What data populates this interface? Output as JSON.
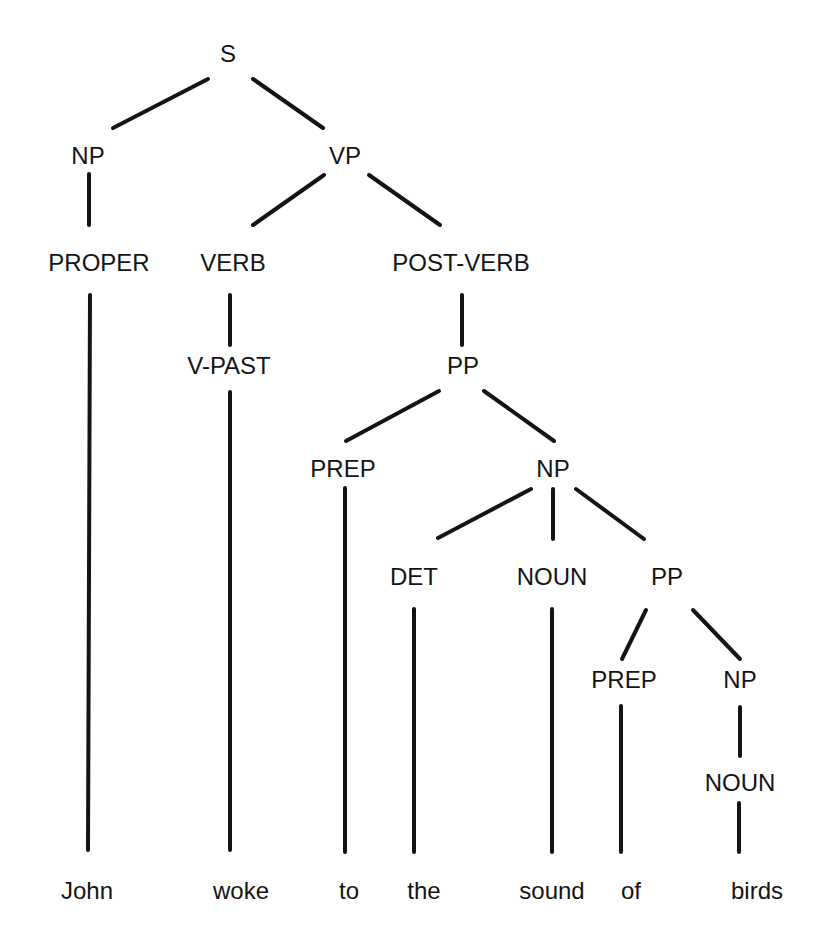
{
  "diagram": {
    "type": "parse-tree",
    "sentence": "John woke to the sound of birds",
    "colors": {
      "background": "#ffffff",
      "ink": "#141414"
    },
    "nodes": {
      "s": {
        "label": "S",
        "x": 228,
        "y": 56
      },
      "np1": {
        "label": "NP",
        "x": 88,
        "y": 158
      },
      "vp": {
        "label": "VP",
        "x": 345,
        "y": 158
      },
      "proper": {
        "label": "PROPER",
        "x": 99,
        "y": 265
      },
      "verb": {
        "label": "VERB",
        "x": 233,
        "y": 265
      },
      "postverb": {
        "label": "POST-VERB",
        "x": 461,
        "y": 265
      },
      "vpast": {
        "label": "V-PAST",
        "x": 229,
        "y": 368
      },
      "pp1": {
        "label": "PP",
        "x": 463,
        "y": 368
      },
      "prep1": {
        "label": "PREP",
        "x": 343,
        "y": 471
      },
      "np2": {
        "label": "NP",
        "x": 553,
        "y": 471
      },
      "det": {
        "label": "DET",
        "x": 414,
        "y": 579
      },
      "noun1": {
        "label": "NOUN",
        "x": 552,
        "y": 579
      },
      "pp2": {
        "label": "PP",
        "x": 667,
        "y": 579
      },
      "prep2": {
        "label": "PREP",
        "x": 624,
        "y": 682
      },
      "np3": {
        "label": "NP",
        "x": 740,
        "y": 682
      },
      "noun2": {
        "label": "NOUN",
        "x": 740,
        "y": 785
      }
    },
    "words": [
      {
        "text": "John",
        "x": 87,
        "y": 893
      },
      {
        "text": "woke",
        "x": 241,
        "y": 893
      },
      {
        "text": "to",
        "x": 349,
        "y": 893
      },
      {
        "text": "the",
        "x": 424,
        "y": 893
      },
      {
        "text": "sound",
        "x": 552,
        "y": 893
      },
      {
        "text": "of",
        "x": 631,
        "y": 893
      },
      {
        "text": "birds",
        "x": 757,
        "y": 893
      }
    ],
    "edges": [
      {
        "from": "S",
        "to": "NP",
        "x1": 208,
        "y1": 79,
        "x2": 113,
        "y2": 128
      },
      {
        "from": "S",
        "to": "VP",
        "x1": 253,
        "y1": 79,
        "x2": 323,
        "y2": 128
      },
      {
        "from": "NP",
        "to": "PROPER",
        "x1": 89,
        "y1": 174,
        "x2": 89,
        "y2": 225
      },
      {
        "from": "VP",
        "to": "VERB",
        "x1": 324,
        "y1": 175,
        "x2": 253,
        "y2": 225
      },
      {
        "from": "VP",
        "to": "POST-VERB",
        "x1": 369,
        "y1": 175,
        "x2": 440,
        "y2": 225
      },
      {
        "from": "PROPER",
        "to": "John",
        "x1": 90,
        "y1": 295,
        "x2": 88,
        "y2": 850
      },
      {
        "from": "VERB",
        "to": "V-PAST",
        "x1": 230,
        "y1": 295,
        "x2": 230,
        "y2": 345
      },
      {
        "from": "V-PAST",
        "to": "woke",
        "x1": 230,
        "y1": 392,
        "x2": 230,
        "y2": 850
      },
      {
        "from": "POST-VERB",
        "to": "PP",
        "x1": 462,
        "y1": 295,
        "x2": 462,
        "y2": 345
      },
      {
        "from": "PP",
        "to": "PREP",
        "x1": 439,
        "y1": 391,
        "x2": 346,
        "y2": 441
      },
      {
        "from": "PP",
        "to": "NP",
        "x1": 484,
        "y1": 391,
        "x2": 554,
        "y2": 441
      },
      {
        "from": "PREP",
        "to": "to",
        "x1": 345,
        "y1": 488,
        "x2": 345,
        "y2": 852
      },
      {
        "from": "NP",
        "to": "DET",
        "x1": 531,
        "y1": 489,
        "x2": 438,
        "y2": 538
      },
      {
        "from": "NP",
        "to": "NOUN",
        "x1": 553,
        "y1": 489,
        "x2": 553,
        "y2": 539
      },
      {
        "from": "NP",
        "to": "PP",
        "x1": 576,
        "y1": 489,
        "x2": 644,
        "y2": 539
      },
      {
        "from": "DET",
        "to": "the",
        "x1": 414,
        "y1": 609,
        "x2": 414,
        "y2": 852
      },
      {
        "from": "NOUN",
        "to": "sound",
        "x1": 552,
        "y1": 609,
        "x2": 552,
        "y2": 852
      },
      {
        "from": "PP",
        "to": "PREP",
        "x1": 646,
        "y1": 610,
        "x2": 622,
        "y2": 659
      },
      {
        "from": "PP",
        "to": "NP",
        "x1": 693,
        "y1": 610,
        "x2": 740,
        "y2": 659
      },
      {
        "from": "PREP",
        "to": "of",
        "x1": 621,
        "y1": 706,
        "x2": 621,
        "y2": 852
      },
      {
        "from": "NP",
        "to": "NOUN",
        "x1": 740,
        "y1": 707,
        "x2": 740,
        "y2": 756
      },
      {
        "from": "NOUN",
        "to": "birds",
        "x1": 739,
        "y1": 803,
        "x2": 739,
        "y2": 852
      }
    ]
  }
}
